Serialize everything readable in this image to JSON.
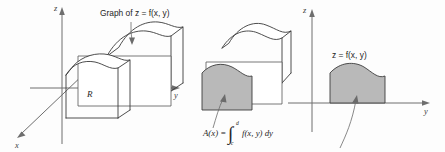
{
  "figure": {
    "background_color": "#fdfdfd",
    "shade_color": "#b9b9b9",
    "line_color": "#3a3a3a",
    "axis_color": "#6e6e6e"
  },
  "panel_left": {
    "name": "solid-under-surface",
    "axes": {
      "z_label": "z",
      "y_label": "y",
      "x_label": "x"
    },
    "callout_label": "Graph of z = f(x, y)",
    "region_label": "R"
  },
  "panel_middle": {
    "name": "sliced-solid",
    "area_formula": {
      "lhs": "A(x) =",
      "integral_sign": "∫",
      "lower_limit": "c",
      "upper_limit": "d",
      "integrand": "f(x, y) dy"
    }
  },
  "panel_right": {
    "name": "cross-section-plane",
    "axes": {
      "z_label": "z",
      "y_label": "y"
    },
    "curve_label": "z = f(x, y)"
  }
}
